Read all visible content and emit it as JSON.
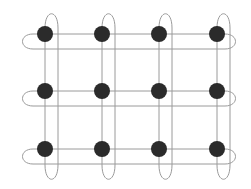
{
  "diagram": {
    "type": "grid-lattice",
    "rows": 3,
    "cols": 4,
    "node_color": "#2b2b2b",
    "loop_color": "#9a9a9a",
    "background": "#ffffff",
    "node_radius": 8,
    "col_x": [
      45,
      102,
      159,
      217
    ],
    "row_y": [
      34,
      91,
      149
    ],
    "horizontal_loop": {
      "x_left": 19,
      "x_right": 239,
      "depth": 15
    },
    "vertical_loop": {
      "y_top": 12,
      "y_bottom": 181,
      "width": 13
    }
  }
}
